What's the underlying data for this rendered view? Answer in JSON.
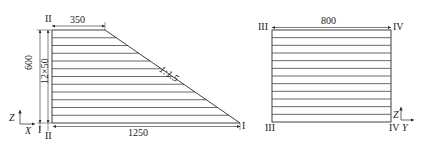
{
  "figure_left": {
    "section_top": "II",
    "section_bottom": "II",
    "section_right": "I",
    "dim_top_width": "350",
    "dim_height": "600",
    "dim_layers": "12×50",
    "dim_bottom_width": "1250",
    "slope_label": "1:1.5",
    "axis_vertical": "Z",
    "axis_horizontal": "X",
    "axis_origin_marker": "I",
    "layer_count": 12
  },
  "figure_right": {
    "section_top_left": "III",
    "section_top_right": "IV",
    "section_bottom_left": "III",
    "section_bottom_right": "IV",
    "dim_width": "800",
    "axis_vertical": "Z",
    "axis_horizontal": "Y",
    "layer_count": 12
  },
  "colors": {
    "line": "#2a2a2a",
    "background": "#ffffff"
  }
}
